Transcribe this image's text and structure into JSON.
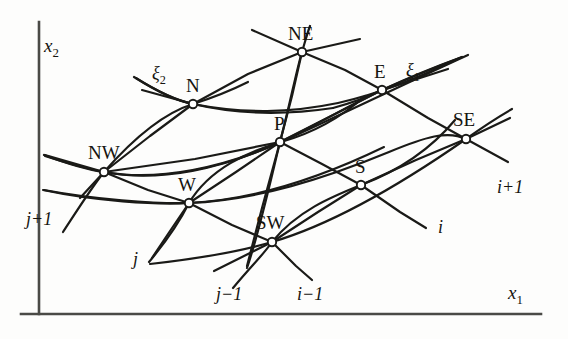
{
  "figure": {
    "type": "curvilinear-grid-stencil-diagram",
    "background_color": "#fdfdfc",
    "line_color": "#1a1a17",
    "node_fill": "#ffffff"
  },
  "axes": {
    "origin": {
      "x": 39,
      "y": 314
    },
    "x_axis": {
      "label": "x",
      "subscript": "1",
      "from": {
        "x": 22,
        "y": 314
      },
      "to": {
        "x": 541,
        "y": 314
      },
      "label_pos": {
        "x": 512,
        "y": 285
      }
    },
    "y_axis": {
      "label": "x",
      "subscript": "2",
      "from": {
        "x": 39,
        "y": 314
      },
      "to": {
        "x": 39,
        "y": 22
      },
      "label_pos": {
        "x": 46,
        "y": 36
      }
    },
    "color": "#4a4a46",
    "width": 2.6
  },
  "nodes": [
    {
      "name": "NE",
      "label": "NE",
      "x": 302,
      "y": 52,
      "label_dx": -14,
      "label_dy": -28
    },
    {
      "name": "N",
      "label": "N",
      "x": 193,
      "y": 104,
      "label_dx": -7,
      "label_dy": -28
    },
    {
      "name": "E",
      "label": "E",
      "x": 382,
      "y": 90,
      "label_dx": -8,
      "label_dy": -28
    },
    {
      "name": "SE",
      "label": "SE",
      "x": 466,
      "y": 139,
      "label_dx": -13,
      "label_dy": -29
    },
    {
      "name": "P",
      "label": "P",
      "x": 280,
      "y": 142,
      "label_dx": -6,
      "label_dy": -28
    },
    {
      "name": "NW",
      "label": "NW",
      "x": 104,
      "y": 172,
      "label_dx": -16,
      "label_dy": -29
    },
    {
      "name": "S",
      "label": "S",
      "x": 361,
      "y": 185,
      "label_dx": -6,
      "label_dy": -28
    },
    {
      "name": "W",
      "label": "W",
      "x": 189,
      "y": 203,
      "label_dx": -11,
      "label_dy": -28
    },
    {
      "name": "SW",
      "label": "SW",
      "x": 272,
      "y": 242,
      "label_dx": -16,
      "label_dy": -29
    }
  ],
  "xi_labels": [
    {
      "name": "xi-2",
      "symbol": "ξ",
      "subscript": "2",
      "x": 152,
      "y": 64
    },
    {
      "name": "xi-1",
      "symbol": "ξ",
      "subscript": "1",
      "x": 406,
      "y": 61
    }
  ],
  "index_labels": [
    {
      "name": "j-plus-1",
      "text": "j+1",
      "x": 26,
      "y": 210
    },
    {
      "name": "j-index",
      "text": "j",
      "x": 133,
      "y": 250
    },
    {
      "name": "j-minus-1",
      "text": "j−1",
      "x": 216,
      "y": 285
    },
    {
      "name": "i-minus-1",
      "text": "i−1",
      "x": 297,
      "y": 285
    },
    {
      "name": "i-index",
      "text": "i",
      "x": 438,
      "y": 218
    },
    {
      "name": "i-plus-1",
      "text": "i+1",
      "x": 497,
      "y": 178
    }
  ],
  "grid_lines": {
    "xi1_family": [
      {
        "name": "xi1-line-top",
        "points": "134,77 193,104 254,118 302,122"
      },
      {
        "name": "xi1-line-middle",
        "points": "45,155 104,172 189,203 272,242"
      },
      {
        "name": "xi1-line-center",
        "points": "90,120 150,135 230,150 300,160"
      }
    ],
    "xi2_family": [
      {
        "name": "xi2-line-left",
        "points": "68,226 104,172 148,120 193,104"
      },
      {
        "name": "xi2-line-right",
        "points": "247,268 280,142 302,52"
      }
    ]
  },
  "stencil_description": {
    "center": "P",
    "neighbors": [
      "N",
      "S",
      "E",
      "W",
      "NE",
      "NW",
      "SE",
      "SW"
    ],
    "coordinate_directions": [
      "ξ1",
      "ξ2"
    ],
    "cartesian_axes": [
      "x1",
      "x2"
    ]
  }
}
